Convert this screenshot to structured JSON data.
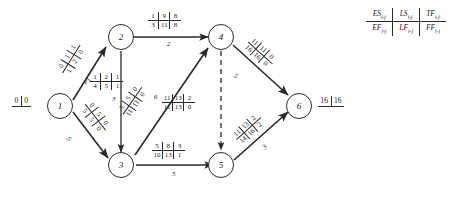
{
  "diagram": {
    "nodes": [
      {
        "id": "n1",
        "label": "1"
      },
      {
        "id": "n2",
        "label": "2"
      },
      {
        "id": "n3",
        "label": "3"
      },
      {
        "id": "n4",
        "label": "4"
      },
      {
        "id": "n5",
        "label": "5"
      },
      {
        "id": "n6",
        "label": "6"
      }
    ],
    "terminals": {
      "start": {
        "left": "0",
        "right": "0"
      },
      "end": {
        "left": "16",
        "right": "16"
      }
    },
    "edges": [
      {
        "id": "e12",
        "from": "1",
        "to": "2",
        "style": "solid",
        "activity_id": "",
        "duration": "1",
        "top": [
          "0",
          "1",
          "1"
        ],
        "bottom": [
          "1",
          "2",
          "0"
        ]
      },
      {
        "id": "e13",
        "from": "1",
        "to": "3",
        "style": "solid",
        "activity_id": "",
        "duration": "5",
        "top": [
          "0",
          "5",
          "0"
        ],
        "bottom": [
          "5",
          "5",
          "0"
        ]
      },
      {
        "id": "e24",
        "from": "2",
        "to": "4",
        "style": "solid",
        "activity_id": "",
        "duration": "2",
        "top": [
          "1",
          "9",
          "8"
        ],
        "bottom": [
          "3",
          "11",
          "8"
        ]
      },
      {
        "id": "e23",
        "from": "2",
        "to": "3",
        "style": "solid",
        "activity_id": "1",
        "duration": "3",
        "top": [
          "1",
          "2",
          "1"
        ],
        "bottom": [
          "4",
          "5",
          "1"
        ]
      },
      {
        "id": "e34",
        "from": "3",
        "to": "4",
        "style": "solid",
        "activity_id": "",
        "duration": "6",
        "top": [
          "5",
          "5",
          "0"
        ],
        "bottom": [
          "11",
          "11",
          "0"
        ]
      },
      {
        "id": "e35",
        "from": "3",
        "to": "5",
        "style": "solid",
        "activity_id": "",
        "duration": "5",
        "top": [
          "5",
          "8",
          "3"
        ],
        "bottom": [
          "10",
          "13",
          "1"
        ]
      },
      {
        "id": "e45",
        "from": "4",
        "to": "5",
        "style": "dashed",
        "activity_id": "",
        "duration": "",
        "top": [
          "11",
          "13",
          "2"
        ],
        "bottom": [
          "11",
          "13",
          "0"
        ]
      },
      {
        "id": "e46",
        "from": "4",
        "to": "6",
        "style": "solid",
        "activity_id": "",
        "duration": "5",
        "top": [
          "11",
          "11",
          "0"
        ],
        "bottom": [
          "16",
          "16",
          "0"
        ]
      },
      {
        "id": "e56",
        "from": "5",
        "to": "6",
        "style": "solid",
        "activity_id": "",
        "duration": "3",
        "top": [
          "11",
          "13",
          "2"
        ],
        "bottom": [
          "14",
          "16",
          "2"
        ]
      }
    ],
    "legend": {
      "row_top": [
        "ES",
        "LS",
        "TF"
      ],
      "row_bottom": [
        "EF",
        "LF",
        "FF"
      ],
      "subscript": "i-j"
    }
  },
  "colors": {
    "ink": "#1a1a1a",
    "stroke": "#2a2a2a",
    "background": "#ffffff"
  }
}
